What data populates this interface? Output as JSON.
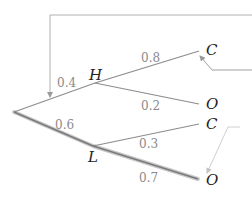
{
  "diagram": {
    "type": "probability-tree",
    "colors": {
      "branch": "#8c8c8c",
      "highlight": "#b8b8b8",
      "annotation_line": "#b0b0b0",
      "annotation_line_light": "#cfcfcf",
      "node_text": "#222222",
      "prob_text": "#8a8a8a"
    },
    "root": {
      "label": ""
    },
    "level1": [
      {
        "label": "H",
        "probability": "0.4"
      },
      {
        "label": "L",
        "probability": "0.6"
      }
    ],
    "level2": [
      {
        "parent": "H",
        "label": "C",
        "probability": "0.8"
      },
      {
        "parent": "H",
        "label": "O",
        "probability": "0.2"
      },
      {
        "parent": "L",
        "label": "C",
        "probability": "0.3"
      },
      {
        "parent": "L",
        "label": "O",
        "probability": "0.7"
      }
    ],
    "highlighted_path": [
      "root",
      "L",
      "O"
    ]
  }
}
